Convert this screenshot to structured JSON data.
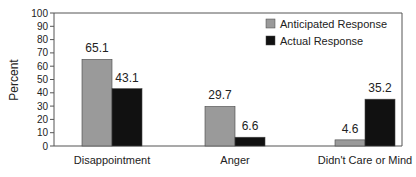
{
  "chart_data": {
    "type": "bar",
    "title": "",
    "xlabel": "",
    "ylabel": "Percent",
    "ylim": [
      0,
      100
    ],
    "yticks": [
      0,
      10,
      20,
      30,
      40,
      50,
      60,
      70,
      80,
      90,
      100
    ],
    "categories": [
      "Disappointment",
      "Anger",
      "Didn't Care or Mind"
    ],
    "series": [
      {
        "name": "Anticipated Response",
        "color": "#9a9a9a",
        "values": [
          65.1,
          29.7,
          4.6
        ]
      },
      {
        "name": "Actual Response",
        "color": "#111111",
        "values": [
          43.1,
          6.6,
          35.2
        ]
      }
    ],
    "legend_position": "upper right",
    "grid": false,
    "data_labels": true
  }
}
